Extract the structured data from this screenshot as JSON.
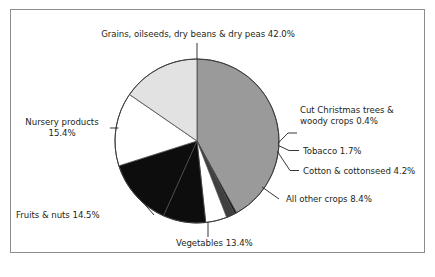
{
  "figure": {
    "background_color": "#ffffff",
    "frame_border_color": "#8d8d8d",
    "leader_line_color": "#231f20"
  },
  "chart_data": {
    "type": "pie",
    "title": "",
    "subtitle": "",
    "xlabel": "",
    "ylabel": "",
    "legend_position": "callout-labels",
    "grid": false,
    "units": "percent",
    "total": 100.0,
    "start_angle_deg": -90,
    "direction": "clockwise",
    "categories": [
      "Grains, oilseeds, dry beans & dry peas",
      "Cut Christmas trees & woody crops",
      "Tobacco",
      "Cotton & cottonseed",
      "All other crops",
      "Vegetables",
      "Fruits & nuts",
      "Nursery products"
    ],
    "values": [
      42.0,
      0.4,
      1.7,
      4.2,
      8.4,
      13.4,
      14.5,
      15.4
    ],
    "colors": [
      "#9a9a9a",
      "#141414",
      "#3f3f3f",
      "#ffffff",
      "#0d0d0d",
      "#0d0d0d",
      "#ffffff",
      "#e2e2e2"
    ],
    "slice_labels": [
      "Grains, oilseeds, dry beans & dry peas 42.0%",
      "Cut Christmas trees & woody crops 0.4%",
      "Tobacco 1.7%",
      "Cotton & cottonseed 4.2%",
      "All other crops 8.4%",
      "Vegetables 13.4%",
      "Fruits & nuts 14.5%",
      "Nursery products 15.4%"
    ]
  },
  "labels": {
    "grains": "Grains, oilseeds, dry beans & dry peas 42.0%",
    "xmas_line1": "Cut Christmas trees &",
    "xmas_line2": "woody crops 0.4%",
    "tobacco": "Tobacco 1.7%",
    "cotton": "Cotton & cottonseed 4.2%",
    "other": "All other crops 8.4%",
    "vegetables": "Vegetables 13.4%",
    "fruits": "Fruits & nuts 14.5%",
    "nursery_line1": "Nursery products",
    "nursery_line2": "15.4%"
  }
}
